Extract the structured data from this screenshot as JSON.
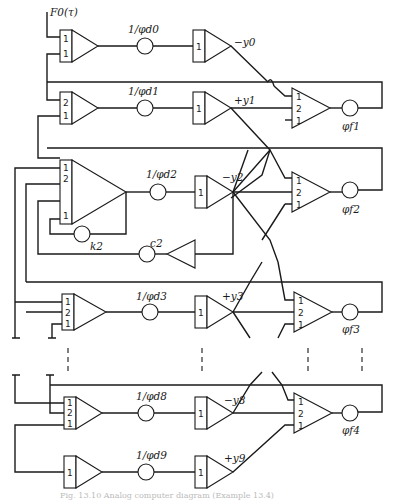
{
  "figure": {
    "colors": {
      "ink": "#1a1a1a",
      "background": "#ffffff",
      "caption": "#bbbbbb"
    },
    "input_label": "F0(τ)",
    "rows": [
      {
        "id": "row0",
        "input_amp_gains": [
          "1",
          "1"
        ],
        "pot_label": "1/φd0",
        "second_amp_gain": "1",
        "output_label": "−y0"
      },
      {
        "id": "row1",
        "input_amp_gains": [
          "2",
          "1"
        ],
        "pot_label": "1/φd1",
        "second_amp_gain": "1",
        "output_label": "+y1"
      },
      {
        "id": "row2",
        "input_amp_gains": [
          "1",
          "2",
          "1"
        ],
        "pot_label": "1/φd2",
        "second_amp_gain": "1",
        "output_label": "−y2"
      },
      {
        "id": "row3",
        "input_amp_gains": [
          "1",
          "2",
          "1"
        ],
        "pot_label": "1/φd3",
        "second_amp_gain": "1",
        "output_label": "+y3"
      },
      {
        "id": "row8",
        "input_amp_gains": [
          "1",
          "2",
          "1"
        ],
        "pot_label": "1/φd8",
        "second_amp_gain": "1",
        "output_label": "−y8"
      },
      {
        "id": "row9",
        "input_amp_gains": [
          "1"
        ],
        "pot_label": "1/φd9",
        "second_amp_gain": "1",
        "output_label": "+y9"
      }
    ],
    "feedback": {
      "pot_k": "k2",
      "pot_c": "c2"
    },
    "output_amps": [
      {
        "id": "out1",
        "gains": [
          "1",
          "2",
          "1"
        ],
        "label": "φf1"
      },
      {
        "id": "out2",
        "gains": [
          "1",
          "2",
          "1"
        ],
        "label": "φf2"
      },
      {
        "id": "out3",
        "gains": [
          "1",
          "2",
          "1"
        ],
        "label": "φf3"
      },
      {
        "id": "out4",
        "gains": [
          "1",
          "2",
          "1"
        ],
        "label": "φf4"
      }
    ],
    "caption": "Fig. 13.10  Analog computer diagram (Example 13.4)"
  }
}
